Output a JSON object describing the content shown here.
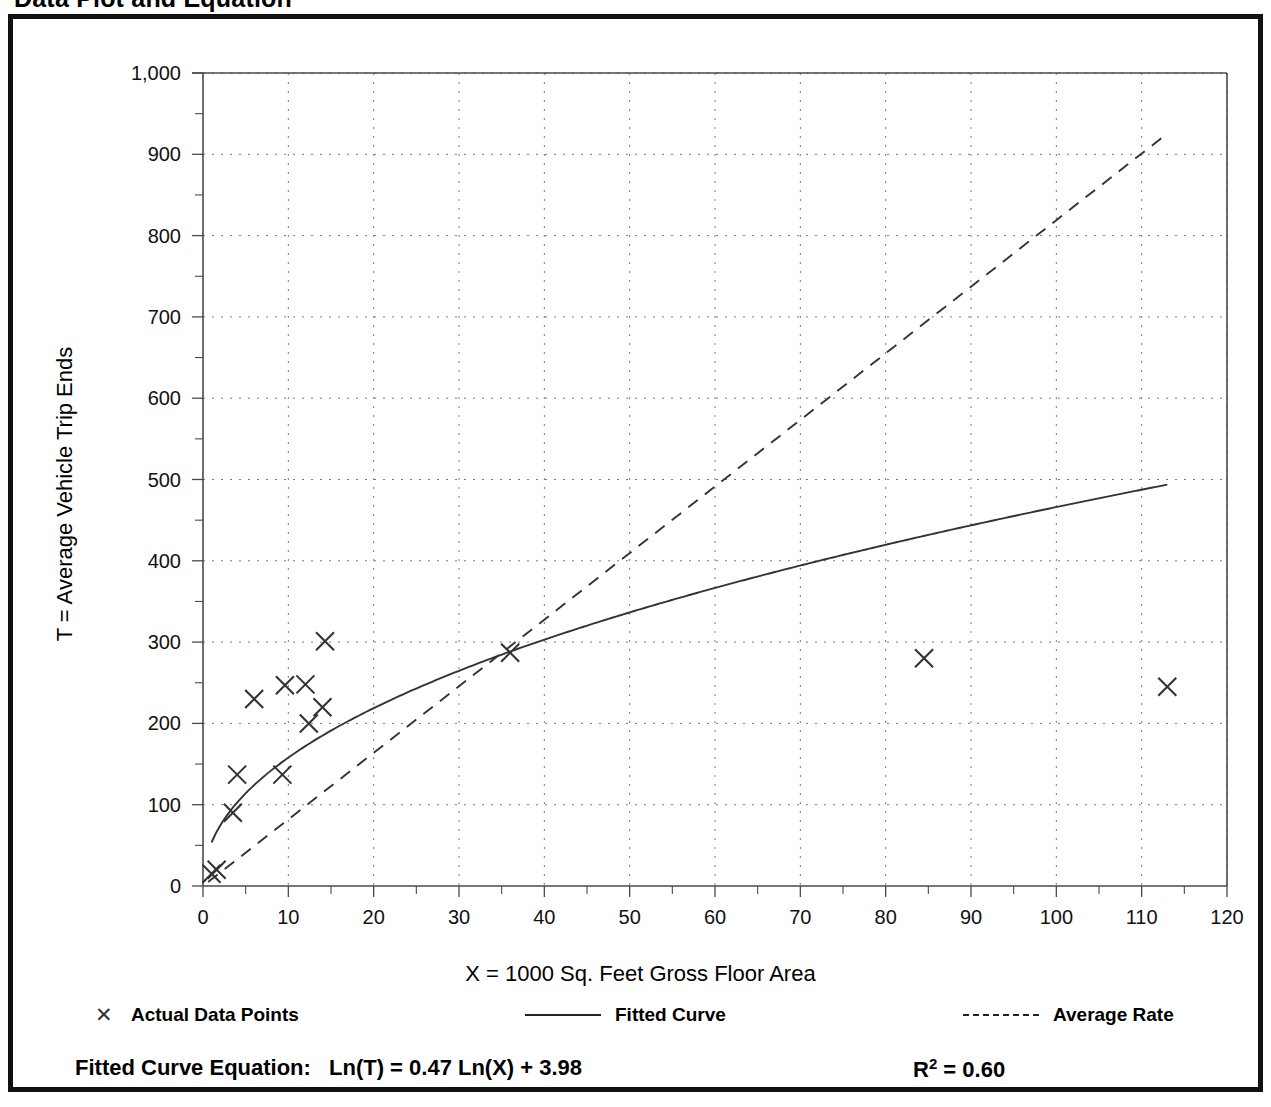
{
  "page": {
    "title": "Data Plot and Equation"
  },
  "legend": {
    "points_label": "Actual Data Points",
    "points_glyph": "✕",
    "fitted_label": "Fitted Curve",
    "average_label": "Average Rate"
  },
  "equation": {
    "prefix": "Fitted Curve Equation:",
    "body": "Ln(T) = 0.47 Ln(X) + 3.98",
    "r_label": "R",
    "r_exponent": "2",
    "r_value": "= 0.60"
  },
  "chart_data": {
    "type": "scatter",
    "title": "Data Plot and Equation",
    "xlabel": "X = 1000 Sq. Feet Gross Floor Area",
    "ylabel": "T = Average Vehicle Trip Ends",
    "xlim": [
      0,
      120
    ],
    "ylim": [
      0,
      1000
    ],
    "xticks": [
      0,
      10,
      20,
      30,
      40,
      50,
      60,
      70,
      80,
      90,
      100,
      110,
      120
    ],
    "xtick_labels": [
      "0",
      "10",
      "20",
      "30",
      "40",
      "50",
      "60",
      "70",
      "80",
      "90",
      "100",
      "110",
      "120"
    ],
    "xtick_minor_step": 5,
    "yticks": [
      0,
      100,
      200,
      300,
      400,
      500,
      600,
      700,
      800,
      900,
      1000
    ],
    "ytick_labels": [
      "0",
      "100",
      "200",
      "300",
      "400",
      "500",
      "600",
      "700",
      "800",
      "900",
      "1,000"
    ],
    "ytick_minor_step": 50,
    "grid": true,
    "grid_style": "dotted",
    "legend_position": "below-plot",
    "series": [
      {
        "name": "Actual Data Points",
        "type": "scatter",
        "marker": "x",
        "points": [
          [
            1.0,
            15
          ],
          [
            1.6,
            20
          ],
          [
            3.5,
            90
          ],
          [
            4.0,
            137
          ],
          [
            6.0,
            230
          ],
          [
            9.3,
            137
          ],
          [
            9.6,
            247
          ],
          [
            12.0,
            248
          ],
          [
            12.4,
            200
          ],
          [
            14.0,
            220
          ],
          [
            14.3,
            301
          ],
          [
            36.0,
            287
          ],
          [
            84.5,
            280
          ],
          [
            113.0,
            245
          ]
        ]
      },
      {
        "name": "Fitted Curve",
        "type": "line",
        "style": "solid",
        "equation": "Ln(T) = 0.47 Ln(X) + 3.98",
        "coefficient_a": 0.47,
        "coefficient_b": 3.98,
        "r_squared": 0.6,
        "x_start": 1.0,
        "x_end": 113.0
      },
      {
        "name": "Average Rate",
        "type": "line",
        "style": "dashed",
        "slope": 8.19,
        "intercept": 0,
        "x_start": 0.6,
        "x_end": 113.0
      }
    ]
  }
}
